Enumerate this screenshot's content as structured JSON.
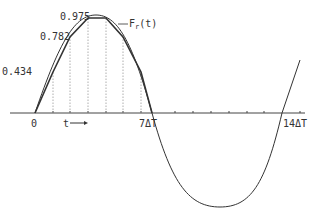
{
  "diagram": {
    "labels": {
      "origin": "0",
      "time_axis": "t",
      "half_period": "7ΔT",
      "full_period": "14ΔT",
      "curve": "F",
      "curve_sub": "r",
      "curve_arg": "(t)",
      "sample_1": "0.434",
      "sample_2": "0.782",
      "sample_3": "0.975"
    },
    "colors": {
      "curve": "#333333",
      "axis": "#444444",
      "sample_lines": "#888888"
    }
  }
}
